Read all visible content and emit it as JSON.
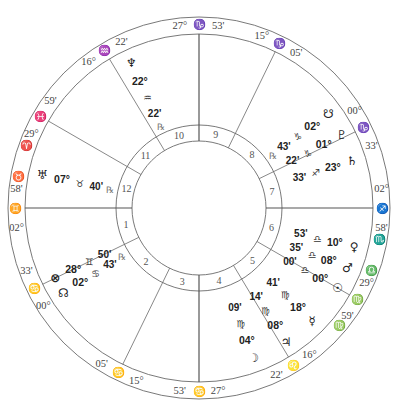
{
  "chart": {
    "center": [
      199,
      208
    ],
    "radii": {
      "outer": 191,
      "zodiac_inner": 174,
      "house_outer": 83,
      "house_inner": 67
    },
    "colors": {
      "line": "#6a6a6a",
      "text": "#222222",
      "muted": "#777777"
    }
  },
  "cusps": [
    {
      "house": 1,
      "label": "ASC",
      "angle_deg": 180,
      "degree": "02°",
      "sign": "♊",
      "minute": "58'"
    },
    {
      "house": 2,
      "angle_deg": 206,
      "degree": "00°",
      "sign": "♋",
      "minute": "33'"
    },
    {
      "house": 3,
      "angle_deg": 244,
      "degree": "15°",
      "sign": "♋",
      "minute": "05'"
    },
    {
      "house": 4,
      "label": "IC",
      "angle_deg": 270,
      "degree": "27°",
      "sign": "♋",
      "minute": "53'"
    },
    {
      "house": 5,
      "angle_deg": 301,
      "degree": "16°",
      "sign": "♌",
      "minute": "22'"
    },
    {
      "house": 6,
      "angle_deg": 330,
      "degree": "29°",
      "sign": "♍",
      "minute": "59'"
    },
    {
      "house": 7,
      "label": "DSC",
      "angle_deg": 0,
      "degree": "02°",
      "sign": "♐",
      "minute": "58'"
    },
    {
      "house": 8,
      "angle_deg": 26,
      "degree": "00°",
      "sign": "♑",
      "minute": "33'"
    },
    {
      "house": 9,
      "angle_deg": 64,
      "degree": "15°",
      "sign": "♑",
      "minute": "05'"
    },
    {
      "house": 10,
      "label": "MC",
      "angle_deg": 90,
      "degree": "27°",
      "sign": "♑",
      "minute": "53'"
    },
    {
      "house": 11,
      "angle_deg": 121,
      "degree": "16°",
      "sign": "♒",
      "minute": "22'"
    },
    {
      "house": 12,
      "angle_deg": 150,
      "degree": "29°",
      "sign": "♓",
      "minute": "59'"
    }
  ],
  "cusp_extra_signs": [
    {
      "sign": "♈",
      "angle_deg": 160
    },
    {
      "sign": "♉",
      "angle_deg": 170
    },
    {
      "sign": "♏",
      "angle_deg": 350
    },
    {
      "sign": "♎",
      "angle_deg": 340
    },
    {
      "sign": "♍",
      "angle_deg": 320
    }
  ],
  "planets": [
    {
      "name": "Neptune",
      "glyph": "♆",
      "degree": "22°",
      "sign": "♒",
      "minute": "22'",
      "retrograde": true,
      "angle_deg": 115
    },
    {
      "name": "Uranus",
      "glyph": "♅",
      "degree": "07°",
      "sign": "♉",
      "minute": "40'",
      "retrograde": true,
      "angle_deg": 168
    },
    {
      "name": "Part of Fortune",
      "glyph": "⊗",
      "degree": "28°",
      "sign": "♊",
      "minute": "50'",
      "retrograde": false,
      "angle_deg": 206
    },
    {
      "name": "North Node",
      "glyph": "☊",
      "degree": "02°",
      "sign": "♋",
      "minute": "43'",
      "retrograde": true,
      "angle_deg": 212
    },
    {
      "name": "Moon",
      "glyph": "☽",
      "degree": "04°",
      "sign": "♍",
      "minute": "09'",
      "retrograde": false,
      "angle_deg": 290
    },
    {
      "name": "Jupiter",
      "glyph": "♃",
      "degree": "08°",
      "sign": "♍",
      "minute": "14'",
      "retrograde": false,
      "angle_deg": 303
    },
    {
      "name": "Mercury",
      "glyph": "☿",
      "degree": "18°",
      "sign": "♍",
      "minute": "41'",
      "retrograde": false,
      "angle_deg": 315
    },
    {
      "name": "Sun",
      "glyph": "☉",
      "degree": "00°",
      "sign": "♎",
      "minute": "00'",
      "retrograde": false,
      "angle_deg": 330
    },
    {
      "name": "Mars",
      "glyph": "♂",
      "degree": "08°",
      "sign": "♎",
      "minute": "35'",
      "retrograde": false,
      "angle_deg": 338
    },
    {
      "name": "Venus",
      "glyph": "♀",
      "degree": "10°",
      "sign": "♎",
      "minute": "53'",
      "retrograde": false,
      "angle_deg": 346
    },
    {
      "name": "Saturn",
      "glyph": "♄",
      "degree": "23°",
      "sign": "♐",
      "minute": "33'",
      "retrograde": false,
      "angle_deg": 17
    },
    {
      "name": "Pluto",
      "glyph": "♇",
      "degree": "01°",
      "sign": "♑",
      "minute": "22'",
      "retrograde": false,
      "angle_deg": 27
    },
    {
      "name": "South Node",
      "glyph": "☋",
      "degree": "02°",
      "sign": "♑",
      "minute": "43'",
      "retrograde": true,
      "angle_deg": 36
    }
  ]
}
